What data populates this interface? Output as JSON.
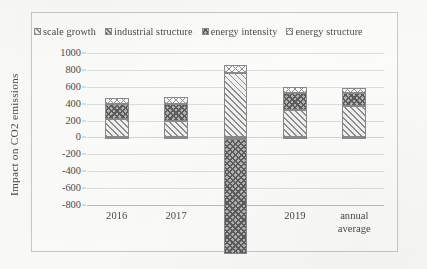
{
  "chart_data": {
    "type": "bar",
    "subtype": "stacked-bar",
    "title": "",
    "xlabel": "",
    "ylabel": "Impact on CO2 emissions",
    "categories": [
      "2016",
      "2017",
      "2018",
      "2019",
      "annual average"
    ],
    "category_lines": [
      [
        "2016"
      ],
      [
        "2017"
      ],
      [
        "2018"
      ],
      [
        "2019"
      ],
      [
        "annual",
        "average"
      ]
    ],
    "series": [
      {
        "name": "scale growth",
        "pattern": "diagonal-stripes-light",
        "values": [
          215,
          190,
          760,
          330,
          375
        ]
      },
      {
        "name": "industrial structure",
        "pattern": "diagonal-stripes-dense",
        "values": [
          -12,
          -16,
          -20,
          -14,
          -15
        ]
      },
      {
        "name": "energy intensity",
        "pattern": "cross-hatch-dark",
        "values": [
          185,
          205,
          -1360,
          195,
          150
        ]
      },
      {
        "name": "energy structure",
        "pattern": "checker-light",
        "values": [
          62,
          85,
          98,
          78,
          60
        ]
      }
    ],
    "bar_tops": [
      460,
      470,
      860,
      600,
      580
    ],
    "bar_bottoms": [
      0,
      0,
      -750,
      0,
      0
    ],
    "ylim": [
      -800,
      1000
    ],
    "ytick_step": 200,
    "yticks": [
      "1000",
      "800",
      "600",
      "400",
      "200",
      "0",
      "-200",
      "-400",
      "-600",
      "-800"
    ],
    "grid": true,
    "legend_position": "top",
    "colors": {
      "gridline": "#dedede",
      "bar_border": "#8a8a8a",
      "text": "#4a4a4a",
      "frame": "#c9c9c7",
      "background": "#fdfdfc"
    }
  },
  "legend": {
    "items": [
      {
        "label": "scale growth",
        "swatch": "legend-swatch-scale-growth"
      },
      {
        "label": "industrial structure",
        "swatch": "legend-swatch-industrial-structure"
      },
      {
        "label": "energy intensity",
        "swatch": "legend-swatch-energy-intensity"
      },
      {
        "label": "energy structure",
        "swatch": "legend-swatch-energy-structure"
      }
    ]
  },
  "axes": {
    "y_title": "Impact on CO2 emissions"
  }
}
